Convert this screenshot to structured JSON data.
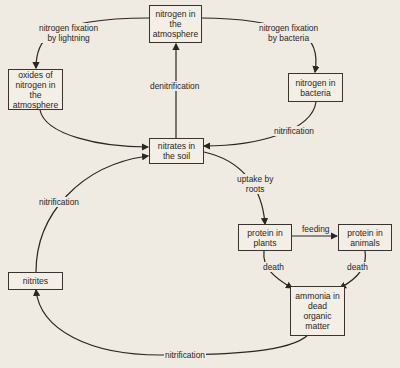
{
  "diagram": {
    "nodes": {
      "n2_atmosphere": "nitrogen in\nthe\natmosphere",
      "oxides": "oxides of\nnitrogen in\nthe\natmosphere",
      "n_bacteria": "nitrogen in\nbacteria",
      "nitrates_soil": "nitrates in\nthe soil",
      "protein_plants": "protein in\nplants",
      "protein_animals": "protein in\nanimals",
      "nitrites": "nitrites",
      "ammonia": "ammonia in\ndead\norganic\nmatter"
    },
    "edges": {
      "fixation_lightning": "nitrogen fixation\nby lightning",
      "fixation_bacteria": "nitrogen fixation\nby bacteria",
      "denitrification": "denitrification",
      "nitrification_bacteria": "nitrification",
      "uptake_roots": "uptake by\nroots",
      "feeding": "feeding",
      "death_plants": "death",
      "death_animals": "death",
      "nitrification_nitrites": "nitrification",
      "nitrification_ammonia": "nitrification"
    }
  }
}
